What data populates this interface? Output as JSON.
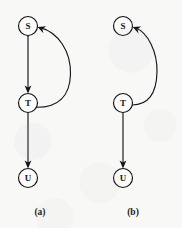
{
  "figure": {
    "background_color": "#f8f8f7",
    "ink_color": "#151419",
    "node_fill_color": "#fbfbfa",
    "width": 182,
    "height": 228,
    "diagrams": [
      {
        "id": "a",
        "caption": "(a)",
        "caption_x": 40,
        "caption_y": 215,
        "nodes": [
          {
            "id": "S",
            "label": "S",
            "cx": 28,
            "cy": 26,
            "r": 9.5
          },
          {
            "id": "T",
            "label": "T",
            "cx": 28,
            "cy": 103,
            "r": 9.5
          },
          {
            "id": "U",
            "label": "U",
            "cx": 28,
            "cy": 178,
            "r": 9.5
          }
        ],
        "edges": [
          {
            "id": "a-S-T",
            "from": "S",
            "to": "T",
            "shape": "straight",
            "direction": "down"
          },
          {
            "id": "a-T-S",
            "from": "T",
            "to": "S",
            "shape": "curved",
            "bulge": "right",
            "bulge_extent": 42
          },
          {
            "id": "a-T-U",
            "from": "T",
            "to": "U",
            "shape": "straight",
            "direction": "down"
          }
        ]
      },
      {
        "id": "b",
        "caption": "(b)",
        "caption_x": 133,
        "caption_y": 215,
        "nodes": [
          {
            "id": "S",
            "label": "S",
            "cx": 123,
            "cy": 26,
            "r": 9.5
          },
          {
            "id": "T",
            "label": "T",
            "cx": 123,
            "cy": 103,
            "r": 9.5
          },
          {
            "id": "U",
            "label": "U",
            "cx": 123,
            "cy": 178,
            "r": 9.5
          }
        ],
        "edges": [
          {
            "id": "b-T-S",
            "from": "T",
            "to": "S",
            "shape": "curved",
            "bulge": "right",
            "bulge_extent": 32
          },
          {
            "id": "b-T-U",
            "from": "T",
            "to": "U",
            "shape": "straight",
            "direction": "down"
          }
        ]
      }
    ]
  },
  "geometry": {
    "a_straight_S_T": "M 28,36.2 L 28,91.4",
    "a_arrowhead_T": "M 28,93.6 L 24.6,85.6 L 28,87.6 L 31.4,85.6 Z",
    "a_curve_T_S": "M 36.3,107.2 C 58,107.5 70,96 70.5,74 C 71,51 58,32.5 40.5,27.6",
    "a_arrowhead_S": "M 37.6,27.0 L 46.2,26.2 L 42.4,29.0 L 43.4,33.3 Z",
    "a_straight_T_U": "M 28,112.6 L 28,166.2",
    "a_arrowhead_U": "M 28,168.4 L 24.6,160.4 L 28,162.4 L 31.4,160.4 Z",
    "b_curve_T_S": "M 131.2,105.0 C 148,105.5 156.5,94 157,72 C 157.4,51.5 148,33.0 135.6,27.8",
    "b_arrowhead_S": "M 132.7,27.0 L 141.3,26.4 L 137.5,29.1 L 138.5,33.4 Z",
    "b_straight_T_U": "M 123,112.6 L 123,166.2",
    "b_arrowhead_U": "M 123,168.4 L 119.6,160.4 L 123,162.4 L 126.4,160.4 Z"
  }
}
